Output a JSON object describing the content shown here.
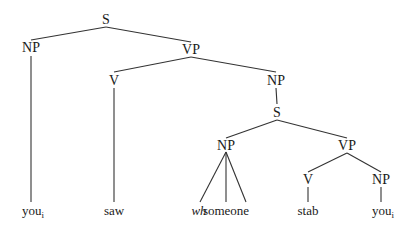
{
  "nodes": [
    {
      "id": "s-root",
      "label": "S",
      "type": "category"
    },
    {
      "id": "np-subject",
      "label": "NP",
      "type": "category"
    },
    {
      "id": "vp-main",
      "label": "VP",
      "type": "category"
    },
    {
      "id": "v-main",
      "label": "V",
      "type": "category"
    },
    {
      "id": "np-object",
      "label": "NP",
      "type": "category"
    },
    {
      "id": "s-embedded",
      "label": "S",
      "type": "category"
    },
    {
      "id": "np-embedded",
      "label": "NP",
      "type": "category"
    },
    {
      "id": "vp-embedded",
      "label": "VP",
      "type": "category"
    },
    {
      "id": "v-embedded",
      "label": "V",
      "type": "category"
    },
    {
      "id": "np-inner",
      "label": "NP",
      "type": "category"
    },
    {
      "id": "leaf-you-1",
      "label": "you",
      "subscript": "i",
      "type": "leaf"
    },
    {
      "id": "leaf-saw",
      "label": "saw",
      "type": "leaf"
    },
    {
      "id": "leaf-wh",
      "label": "wh",
      "type": "leaf",
      "italic": true
    },
    {
      "id": "leaf-someone",
      "label": "someone",
      "type": "leaf"
    },
    {
      "id": "leaf-stab",
      "label": "stab",
      "type": "leaf"
    },
    {
      "id": "leaf-you-2",
      "label": "you",
      "subscript": "i",
      "type": "leaf"
    }
  ],
  "edges": [
    [
      "s-root",
      "np-subject"
    ],
    [
      "s-root",
      "vp-main"
    ],
    [
      "np-subject",
      "leaf-you-1"
    ],
    [
      "vp-main",
      "v-main"
    ],
    [
      "vp-main",
      "np-object"
    ],
    [
      "v-main",
      "leaf-saw"
    ],
    [
      "np-object",
      "s-embedded"
    ],
    [
      "s-embedded",
      "np-embedded"
    ],
    [
      "s-embedded",
      "vp-embedded"
    ],
    [
      "np-embedded",
      "leaf-wh"
    ],
    [
      "np-embedded",
      "leaf-someone"
    ],
    [
      "np-embedded",
      "leaf-the"
    ],
    [
      "vp-embedded",
      "v-embedded"
    ],
    [
      "vp-embedded",
      "np-inner"
    ],
    [
      "v-embedded",
      "leaf-stab"
    ],
    [
      "np-inner",
      "leaf-you-2"
    ]
  ],
  "colors": {
    "line": "#333333",
    "text": "#1a1a1a",
    "background": "#ffffff"
  }
}
